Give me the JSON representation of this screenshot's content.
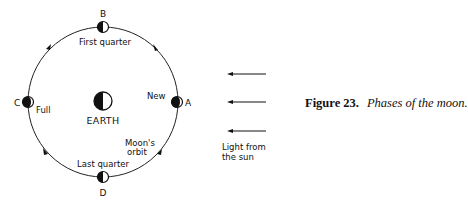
{
  "figure": {
    "number_label": "Figure 23.",
    "title": "Phases of the moon."
  },
  "center": {
    "label": "EARTH"
  },
  "orbit": {
    "label_line1": "Moon's",
    "label_line2": "orbit"
  },
  "positions": [
    {
      "id": "A",
      "phase": "New"
    },
    {
      "id": "B",
      "phase": "First quarter"
    },
    {
      "id": "C",
      "phase": "Full"
    },
    {
      "id": "D",
      "phase": "Last quarter"
    }
  ],
  "sunlight": {
    "label_line1": "Light from",
    "label_line2": "the sun",
    "arrow_count": 3
  }
}
